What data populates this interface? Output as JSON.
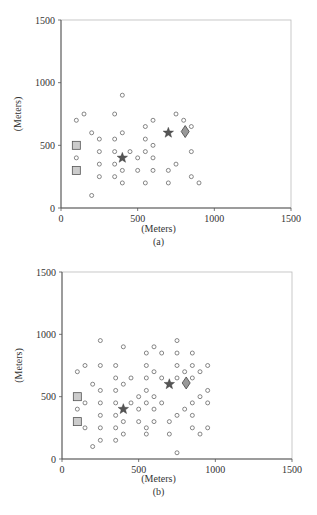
{
  "figure": {
    "panels": [
      {
        "id": "a",
        "caption": "(a)",
        "xlabel": "(Meters)",
        "ylabel": "(Meters)"
      },
      {
        "id": "b",
        "caption": "(b)",
        "xlabel": "(Meters)",
        "ylabel": "(Meters)"
      }
    ]
  },
  "chart_data": [
    {
      "type": "scatter",
      "title": "",
      "caption": "(a)",
      "xlabel": "(Meters)",
      "ylabel": "(Meters)",
      "xlim": [
        0,
        1500
      ],
      "ylim": [
        0,
        1500
      ],
      "xticks": [
        0,
        500,
        1000,
        1500
      ],
      "yticks": [
        0,
        500,
        1000,
        1500
      ],
      "grid": false,
      "series": [
        {
          "name": "nodes",
          "marker": "circle",
          "points": [
            [
              100,
              700
            ],
            [
              150,
              750
            ],
            [
              350,
              750
            ],
            [
              400,
              900
            ],
            [
              200,
              600
            ],
            [
              250,
              550
            ],
            [
              350,
              550
            ],
            [
              400,
              600
            ],
            [
              250,
              450
            ],
            [
              350,
              450
            ],
            [
              450,
              450
            ],
            [
              100,
              400
            ],
            [
              250,
              350
            ],
            [
              350,
              350
            ],
            [
              400,
              300
            ],
            [
              250,
              250
            ],
            [
              350,
              250
            ],
            [
              400,
              200
            ],
            [
              200,
              100
            ],
            [
              500,
              400
            ],
            [
              500,
              300
            ],
            [
              550,
              650
            ],
            [
              600,
              700
            ],
            [
              550,
              550
            ],
            [
              550,
              450
            ],
            [
              600,
              500
            ],
            [
              600,
              400
            ],
            [
              600,
              300
            ],
            [
              550,
              200
            ],
            [
              700,
              300
            ],
            [
              700,
              200
            ],
            [
              750,
              750
            ],
            [
              800,
              700
            ],
            [
              850,
              650
            ],
            [
              750,
              350
            ],
            [
              850,
              450
            ],
            [
              850,
              250
            ],
            [
              900,
              200
            ]
          ]
        },
        {
          "name": "squares",
          "marker": "square",
          "color": "#cccccc",
          "points": [
            [
              100,
              500
            ],
            [
              100,
              300
            ]
          ]
        },
        {
          "name": "stars",
          "marker": "star",
          "color": "#555555",
          "points": [
            [
              400,
              400
            ],
            [
              700,
              600
            ]
          ]
        },
        {
          "name": "diamond",
          "marker": "diamond",
          "color": "#999999",
          "points": [
            [
              810,
              610
            ]
          ]
        }
      ]
    },
    {
      "type": "scatter",
      "title": "",
      "caption": "(b)",
      "xlabel": "(Meters)",
      "ylabel": "(Meters)",
      "xlim": [
        0,
        1500
      ],
      "ylim": [
        0,
        1500
      ],
      "xticks": [
        0,
        500,
        1000,
        1500
      ],
      "yticks": [
        0,
        500,
        1000,
        1500
      ],
      "grid": false,
      "series": [
        {
          "name": "nodes",
          "marker": "circle",
          "points": [
            [
              250,
              950
            ],
            [
              400,
              900
            ],
            [
              600,
              900
            ],
            [
              750,
              950
            ],
            [
              550,
              850
            ],
            [
              650,
              850
            ],
            [
              750,
              850
            ],
            [
              850,
              850
            ],
            [
              100,
              700
            ],
            [
              150,
              750
            ],
            [
              250,
              750
            ],
            [
              350,
              750
            ],
            [
              550,
              750
            ],
            [
              750,
              750
            ],
            [
              850,
              750
            ],
            [
              950,
              750
            ],
            [
              350,
              650
            ],
            [
              450,
              650
            ],
            [
              550,
              650
            ],
            [
              650,
              650
            ],
            [
              750,
              650
            ],
            [
              850,
              650
            ],
            [
              600,
              700
            ],
            [
              800,
              700
            ],
            [
              900,
              700
            ],
            [
              200,
              600
            ],
            [
              400,
              600
            ],
            [
              250,
              550
            ],
            [
              350,
              550
            ],
            [
              550,
              550
            ],
            [
              950,
              550
            ],
            [
              150,
              450
            ],
            [
              250,
              450
            ],
            [
              350,
              450
            ],
            [
              450,
              450
            ],
            [
              550,
              450
            ],
            [
              650,
              450
            ],
            [
              850,
              450
            ],
            [
              950,
              450
            ],
            [
              500,
              500
            ],
            [
              600,
              500
            ],
            [
              900,
              500
            ],
            [
              100,
              400
            ],
            [
              500,
              400
            ],
            [
              600,
              400
            ],
            [
              800,
              400
            ],
            [
              250,
              350
            ],
            [
              350,
              350
            ],
            [
              750,
              350
            ],
            [
              850,
              350
            ],
            [
              400,
              300
            ],
            [
              500,
              300
            ],
            [
              600,
              300
            ],
            [
              700,
              300
            ],
            [
              150,
              250
            ],
            [
              250,
              250
            ],
            [
              350,
              250
            ],
            [
              550,
              250
            ],
            [
              850,
              250
            ],
            [
              950,
              250
            ],
            [
              400,
              200
            ],
            [
              550,
              200
            ],
            [
              700,
              200
            ],
            [
              900,
              200
            ],
            [
              250,
              150
            ],
            [
              350,
              150
            ],
            [
              200,
              100
            ],
            [
              750,
              50
            ]
          ]
        },
        {
          "name": "squares",
          "marker": "square",
          "color": "#cccccc",
          "points": [
            [
              100,
              500
            ],
            [
              100,
              300
            ]
          ]
        },
        {
          "name": "stars",
          "marker": "star",
          "color": "#555555",
          "points": [
            [
              400,
              400
            ],
            [
              700,
              600
            ]
          ]
        },
        {
          "name": "diamond",
          "marker": "diamond",
          "color": "#999999",
          "points": [
            [
              810,
              610
            ]
          ]
        }
      ]
    }
  ]
}
